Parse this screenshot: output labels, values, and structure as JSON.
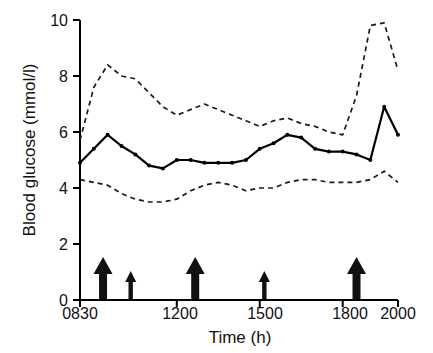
{
  "chart_data": {
    "type": "line",
    "title": "",
    "xlabel": "Time (h)",
    "ylabel": "Blood glucose (mmol/l)",
    "ylim": [
      0,
      10
    ],
    "yticks": [
      0,
      2,
      4,
      6,
      8,
      10
    ],
    "xlim": [
      830,
      2000
    ],
    "xticks": [
      830,
      1200,
      1500,
      1800,
      2000
    ],
    "xticklabels": [
      "0830",
      "1200",
      "1500",
      "1800",
      "2000"
    ],
    "grid": false,
    "legend": "none",
    "x": [
      830,
      900,
      930,
      1000,
      1030,
      1100,
      1130,
      1200,
      1230,
      1300,
      1330,
      1400,
      1430,
      1500,
      1530,
      1600,
      1630,
      1700,
      1730,
      1800,
      1830,
      1900,
      1930,
      2000
    ],
    "series": [
      {
        "name": "Upper reference (dashed)",
        "style": "dashed",
        "marker": "none",
        "values": [
          5.7,
          7.6,
          8.4,
          8.0,
          7.9,
          7.4,
          6.9,
          6.6,
          6.8,
          7.0,
          6.8,
          6.6,
          6.4,
          6.2,
          6.4,
          6.5,
          6.3,
          6.2,
          6.0,
          5.9,
          7.3,
          9.8,
          9.9,
          8.2
        ]
      },
      {
        "name": "Median blood glucose (solid, markers)",
        "style": "solid",
        "marker": "circle",
        "values": [
          4.9,
          5.4,
          5.9,
          5.5,
          5.2,
          4.8,
          4.7,
          5.0,
          5.0,
          4.9,
          4.9,
          4.9,
          5.0,
          5.4,
          5.6,
          5.9,
          5.8,
          5.4,
          5.3,
          5.3,
          5.2,
          5.0,
          6.9,
          5.9
        ]
      },
      {
        "name": "Lower reference (dashed)",
        "style": "dashed",
        "marker": "none",
        "values": [
          4.3,
          4.2,
          4.1,
          3.8,
          3.6,
          3.5,
          3.5,
          3.6,
          3.9,
          4.1,
          4.2,
          4.1,
          3.9,
          4.0,
          4.0,
          4.2,
          4.3,
          4.3,
          4.2,
          4.2,
          4.2,
          4.3,
          4.6,
          4.2
        ]
      }
    ],
    "annotations": {
      "name": "meal-and-snack-arrows",
      "description": "Upward arrows on the x-axis marking meals (large) and snacks (small)",
      "items": [
        {
          "x": 880,
          "size": "large",
          "label": "meal-arrow-breakfast"
        },
        {
          "x": 1020,
          "size": "small",
          "label": "snack-arrow-morning"
        },
        {
          "x": 1240,
          "size": "large",
          "label": "meal-arrow-lunch"
        },
        {
          "x": 1510,
          "size": "small",
          "label": "snack-arrow-afternoon"
        },
        {
          "x": 1830,
          "size": "large",
          "label": "meal-arrow-dinner"
        }
      ]
    },
    "colors": {
      "line": "#000000",
      "dashed": "#1a1a1a",
      "axis": "#000000",
      "background": "#ffffff",
      "arrow": "#111111"
    }
  }
}
